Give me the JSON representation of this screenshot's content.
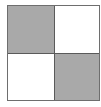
{
  "diagram": {
    "type": "2x2 checkerboard grid",
    "rows": 2,
    "cols": 2,
    "cells": [
      {
        "row": 0,
        "col": 0,
        "fill": "#a9a9a9",
        "shaded": true
      },
      {
        "row": 0,
        "col": 1,
        "fill": "#ffffff",
        "shaded": false
      },
      {
        "row": 1,
        "col": 0,
        "fill": "#ffffff",
        "shaded": false
      },
      {
        "row": 1,
        "col": 1,
        "fill": "#a9a9a9",
        "shaded": true
      }
    ],
    "border_color": "#5a5a5a"
  }
}
